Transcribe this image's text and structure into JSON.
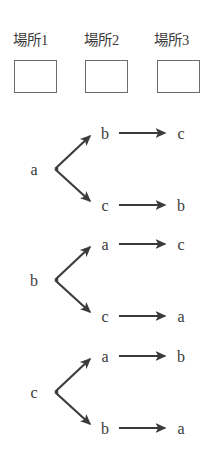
{
  "figure": {
    "background_color": "#ffffff",
    "ink_color": "#3b3b39",
    "box_border_color": "#6b6b69"
  },
  "header": {
    "places": [
      {
        "label": "場所1"
      },
      {
        "label": "場所2"
      },
      {
        "label": "場所3"
      }
    ],
    "boxes": [
      {
        "name": "place-1-box",
        "value": ""
      },
      {
        "name": "place-2-box",
        "value": ""
      },
      {
        "name": "place-3-box",
        "value": ""
      }
    ]
  },
  "trees": [
    {
      "root": "a",
      "branches": [
        {
          "from": "b",
          "to": "c"
        },
        {
          "from": "c",
          "to": "b"
        }
      ]
    },
    {
      "root": "b",
      "branches": [
        {
          "from": "a",
          "to": "c"
        },
        {
          "from": "c",
          "to": "a"
        }
      ]
    },
    {
      "root": "c",
      "branches": [
        {
          "from": "a",
          "to": "b"
        },
        {
          "from": "b",
          "to": "a"
        }
      ]
    }
  ]
}
